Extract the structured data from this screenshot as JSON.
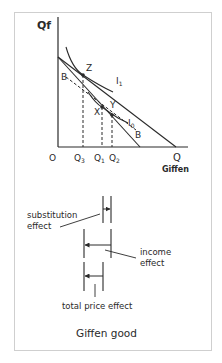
{
  "diagram": {
    "title": "Giffen good",
    "axes": {
      "y_label": "Qf",
      "x_label": "Q",
      "x_sublabel": "Giffen",
      "origin": "O"
    },
    "x_ticks": [
      "Q3",
      "Q1",
      "Q2"
    ],
    "x_tick_display": {
      "q3_main": "Q",
      "q3_sub": "3",
      "q1_main": "Q",
      "q1_sub": "1",
      "q2_main": "Q",
      "q2_sub": "2"
    },
    "points": [
      "Z",
      "X",
      "Y"
    ],
    "curves": {
      "indifference_high": {
        "main": "I",
        "sub": "1"
      },
      "indifference_low": {
        "main": "I",
        "sub": "0"
      },
      "compensated_budget": "B"
    },
    "effects": {
      "substitution": [
        "substitution",
        "effect"
      ],
      "income": [
        "income",
        "effect"
      ],
      "total": "total price effect"
    },
    "colors": {
      "line": "#2a2a2a",
      "frame": "#cfcfcf",
      "background": "#ffffff"
    }
  }
}
